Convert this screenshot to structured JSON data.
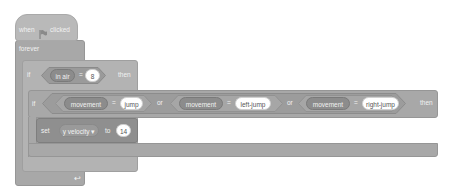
{
  "hat_block": {
    "when": "when",
    "icon": "green-flag-icon",
    "clicked": "clicked"
  },
  "forever_block": {
    "label": "forever",
    "loop_icon": "loop-arrow-icon"
  },
  "outer_if": {
    "if_label": "if",
    "condition": {
      "variable": "in air",
      "operator": "=",
      "value": "8"
    },
    "then_label": "then"
  },
  "inner_if": {
    "if_label": "if",
    "conditions": [
      {
        "variable": "movement",
        "operator": "=",
        "value": "jump"
      },
      {
        "variable": "movement",
        "operator": "=",
        "value": "left-jump"
      },
      {
        "variable": "movement",
        "operator": "=",
        "value": "right-jump"
      }
    ],
    "joiners": [
      "or",
      "or"
    ],
    "then_label": "then"
  },
  "set_block": {
    "set_label": "set",
    "variable": "y velocity",
    "dropdown_arrow": "▾",
    "to_label": "to",
    "value": "14"
  }
}
